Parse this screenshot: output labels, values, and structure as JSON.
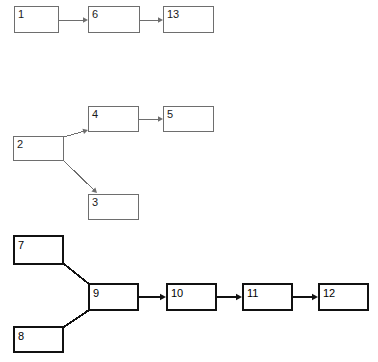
{
  "diagram": {
    "type": "flow-chart",
    "canvas": {
      "width": 378,
      "height": 362,
      "background": "#ffffff"
    },
    "styles": {
      "thin_stroke": "#6e6e6e",
      "thick_stroke": "#111111",
      "node_fill": "#ffffff",
      "label_color": "#1a1a1a"
    },
    "groups": [
      {
        "name": "chain-top",
        "weight": "thin",
        "nodes": [
          "1",
          "6",
          "13"
        ]
      },
      {
        "name": "branch-middle",
        "weight": "thin",
        "nodes": [
          "2",
          "4",
          "5",
          "3"
        ]
      },
      {
        "name": "merge-bottom",
        "weight": "thick",
        "nodes": [
          "7",
          "8",
          "9",
          "10",
          "11",
          "12"
        ]
      }
    ],
    "nodes": [
      {
        "id": "n1",
        "label": "1",
        "x": 14,
        "y": 6,
        "w": 45,
        "h": 27,
        "weight": "thin"
      },
      {
        "id": "n6",
        "label": "6",
        "x": 88,
        "y": 6,
        "w": 52,
        "h": 27,
        "weight": "thin"
      },
      {
        "id": "n13",
        "label": "13",
        "x": 163,
        "y": 6,
        "w": 51,
        "h": 27,
        "weight": "thin"
      },
      {
        "id": "n4",
        "label": "4",
        "x": 88,
        "y": 106,
        "w": 51,
        "h": 26,
        "weight": "thin"
      },
      {
        "id": "n5",
        "label": "5",
        "x": 163,
        "y": 106,
        "w": 51,
        "h": 26,
        "weight": "thin"
      },
      {
        "id": "n2",
        "label": "2",
        "x": 13,
        "y": 136,
        "w": 51,
        "h": 25,
        "weight": "thin"
      },
      {
        "id": "n3",
        "label": "3",
        "x": 88,
        "y": 194,
        "w": 51,
        "h": 26,
        "weight": "thin"
      },
      {
        "id": "n7",
        "label": "7",
        "x": 13,
        "y": 235,
        "w": 51,
        "h": 30,
        "weight": "thick"
      },
      {
        "id": "n9",
        "label": "9",
        "x": 88,
        "y": 283,
        "w": 51,
        "h": 28,
        "weight": "thick"
      },
      {
        "id": "n10",
        "label": "10",
        "x": 166,
        "y": 283,
        "w": 51,
        "h": 28,
        "weight": "thick"
      },
      {
        "id": "n11",
        "label": "11",
        "x": 242,
        "y": 283,
        "w": 51,
        "h": 28,
        "weight": "thick"
      },
      {
        "id": "n12",
        "label": "12",
        "x": 318,
        "y": 283,
        "w": 51,
        "h": 28,
        "weight": "thick"
      },
      {
        "id": "n8",
        "label": "8",
        "x": 13,
        "y": 326,
        "w": 51,
        "h": 27,
        "weight": "thick"
      }
    ],
    "edges": [
      {
        "from": "1",
        "to": "6",
        "weight": "thin",
        "arrow": true,
        "x1": 59,
        "y1": 20,
        "x2": 88,
        "y2": 20
      },
      {
        "from": "6",
        "to": "13",
        "weight": "thin",
        "arrow": true,
        "x1": 140,
        "y1": 20,
        "x2": 163,
        "y2": 20
      },
      {
        "from": "2",
        "to": "4",
        "weight": "thin",
        "arrow": true,
        "x1": 64,
        "y1": 137,
        "x2": 88,
        "y2": 130
      },
      {
        "from": "4",
        "to": "5",
        "weight": "thin",
        "arrow": true,
        "x1": 139,
        "y1": 119,
        "x2": 163,
        "y2": 119
      },
      {
        "from": "2",
        "to": "3",
        "weight": "thin",
        "arrow": true,
        "x1": 64,
        "y1": 161,
        "x2": 97,
        "y2": 193
      },
      {
        "from": "7",
        "to": "9",
        "weight": "thick",
        "arrow": false,
        "x1": 64,
        "y1": 264,
        "x2": 89,
        "y2": 284
      },
      {
        "from": "8",
        "to": "9",
        "weight": "thick",
        "arrow": false,
        "x1": 64,
        "y1": 327,
        "x2": 89,
        "y2": 310
      },
      {
        "from": "9",
        "to": "10",
        "weight": "thick",
        "arrow": true,
        "x1": 139,
        "y1": 297,
        "x2": 166,
        "y2": 297
      },
      {
        "from": "10",
        "to": "11",
        "weight": "thick",
        "arrow": true,
        "x1": 217,
        "y1": 297,
        "x2": 242,
        "y2": 297
      },
      {
        "from": "11",
        "to": "12",
        "weight": "thick",
        "arrow": true,
        "x1": 293,
        "y1": 297,
        "x2": 318,
        "y2": 297
      }
    ]
  }
}
